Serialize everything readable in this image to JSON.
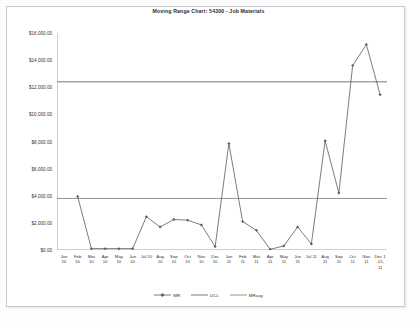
{
  "chart_data": {
    "type": "line",
    "title": "Moving Range Chart: 54300 - Job Materials",
    "xlabel": "",
    "ylabel": "",
    "ylim": [
      0,
      16000
    ],
    "yticks": [
      0,
      2000,
      4000,
      6000,
      8000,
      10000,
      12000,
      14000,
      16000
    ],
    "ytick_labels": [
      "$0.00",
      "$2,000.00",
      "$4,000.00",
      "$6,000.00",
      "$8,000.00",
      "$10,000.00",
      "$12,000.00",
      "$14,000.00",
      "$16,000.00"
    ],
    "grid": false,
    "legend_position": "bottom",
    "categories": [
      "Jan 10",
      "Feb 10",
      "Mar 10",
      "Apr 10",
      "May 10",
      "Jun 10",
      "Jul 10",
      "Aug 10",
      "Sep 10",
      "Oct 10",
      "Nov 10",
      "Dec 10",
      "Jan 11",
      "Feb 11",
      "Mar 11",
      "Apr 11",
      "May 11",
      "Jun 11",
      "Jul 11",
      "Aug 11",
      "Sep 11",
      "Oct 11",
      "Nov 11",
      "Dec 1-15, 11"
    ],
    "tick_labels_two_line": [
      [
        "Jan",
        "10"
      ],
      [
        "Feb",
        "10"
      ],
      [
        "Mar",
        "10"
      ],
      [
        "Apr",
        "10"
      ],
      [
        "May",
        "10"
      ],
      [
        "Jun",
        "10"
      ],
      [
        "Jul 10",
        ""
      ],
      [
        "Aug",
        "10"
      ],
      [
        "Sep",
        "10"
      ],
      [
        "Oct",
        "10"
      ],
      [
        "Nov",
        "10"
      ],
      [
        "Dec",
        "10"
      ],
      [
        "Jan",
        "11"
      ],
      [
        "Feb",
        "11"
      ],
      [
        "Mar",
        "11"
      ],
      [
        "Apr",
        "11"
      ],
      [
        "May",
        "11"
      ],
      [
        "Jun",
        "11"
      ],
      [
        "Jul 11",
        ""
      ],
      [
        "Aug",
        "11"
      ],
      [
        "Sep",
        "11"
      ],
      [
        "Oct",
        "11"
      ],
      [
        "Nov",
        "11"
      ],
      [
        "Dec 1",
        "-15,"
      ]
    ],
    "last_tick_third_line": "11",
    "series": [
      {
        "name": "MR",
        "type": "line-markers",
        "color": "#5a5a5a",
        "values": [
          null,
          3950,
          100,
          100,
          100,
          100,
          2450,
          1700,
          2250,
          2200,
          1850,
          250,
          7850,
          2100,
          1450,
          50,
          300,
          1700,
          450,
          8050,
          4200,
          13600,
          15150,
          11450
        ]
      },
      {
        "name": "UCL",
        "type": "line",
        "color": "#555555",
        "value": 12400
      },
      {
        "name": "MRavg",
        "type": "line",
        "color": "#777777",
        "value": 3800
      }
    ]
  },
  "legend": {
    "items": [
      {
        "label": "MR"
      },
      {
        "label": "UCL"
      },
      {
        "label": "MRavg"
      }
    ]
  }
}
